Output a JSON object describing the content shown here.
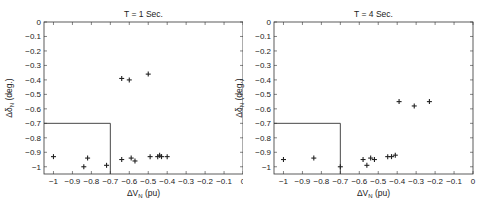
{
  "chart_data": [
    {
      "type": "scatter",
      "title": "T = 1 Sec.",
      "xlabel": "ΔV_N (pu)",
      "ylabel": "Δδ_N (deg.)",
      "xlim": [
        -1.05,
        0
      ],
      "ylim": [
        -1.05,
        0
      ],
      "xticks": [
        -1,
        -0.9,
        -0.8,
        -0.7,
        -0.6,
        -0.5,
        -0.4,
        -0.3,
        -0.2,
        -0.1,
        0
      ],
      "xtick_labels": [
        "-1",
        "-0.9",
        "-0.8",
        "-0.7",
        "-0.6",
        "-0.5",
        "-0.4",
        "-0.3",
        "-0.2",
        "-0.1",
        "0"
      ],
      "yticks": [
        0,
        -0.1,
        -0.2,
        -0.3,
        -0.4,
        -0.5,
        -0.6,
        -0.7,
        -0.8,
        -0.9,
        -1
      ],
      "ytick_labels": [
        "0",
        "-0.1",
        "-0.2",
        "-0.3",
        "-0.4",
        "-0.5",
        "-0.6",
        "-0.7",
        "-0.8",
        "-0.9",
        "-1"
      ],
      "grid": false,
      "marker": "+",
      "region_box": {
        "x": [
          -1.05,
          -0.7
        ],
        "y": [
          -1.05,
          -0.7
        ]
      },
      "points": [
        {
          "x": -1.0,
          "y": -0.93
        },
        {
          "x": -0.84,
          "y": -1.0
        },
        {
          "x": -0.82,
          "y": -0.94
        },
        {
          "x": -0.72,
          "y": -0.99
        },
        {
          "x": -0.64,
          "y": -0.95
        },
        {
          "x": -0.59,
          "y": -0.94
        },
        {
          "x": -0.57,
          "y": -0.96
        },
        {
          "x": -0.49,
          "y": -0.93
        },
        {
          "x": -0.45,
          "y": -0.93
        },
        {
          "x": -0.44,
          "y": -0.92
        },
        {
          "x": -0.43,
          "y": -0.93
        },
        {
          "x": -0.4,
          "y": -0.93
        },
        {
          "x": -0.64,
          "y": -0.39
        },
        {
          "x": -0.6,
          "y": -0.4
        },
        {
          "x": -0.5,
          "y": -0.36
        }
      ]
    },
    {
      "type": "scatter",
      "title": "T = 4 Sec.",
      "xlabel": "ΔV_N (pu)",
      "ylabel": "Δδ_N (deg.)",
      "xlim": [
        -1.05,
        0
      ],
      "ylim": [
        -1.05,
        0
      ],
      "xticks": [
        -1,
        -0.9,
        -0.8,
        -0.7,
        -0.6,
        -0.5,
        -0.4,
        -0.3,
        -0.2,
        -0.1,
        0
      ],
      "xtick_labels": [
        "-1",
        "-0.9",
        "-0.8",
        "-0.7",
        "-0.6",
        "-0.5",
        "-0.4",
        "-0.3",
        "-0.2",
        "-0.1",
        "0"
      ],
      "yticks": [
        0,
        -0.1,
        -0.2,
        -0.3,
        -0.4,
        -0.5,
        -0.6,
        -0.7,
        -0.8,
        -0.9,
        -1
      ],
      "ytick_labels": [
        "0",
        "-0.1",
        "-0.2",
        "-0.3",
        "-0.4",
        "-0.5",
        "-0.6",
        "-0.7",
        "-0.8",
        "-0.9",
        "-1"
      ],
      "grid": false,
      "marker": "+",
      "region_box": {
        "x": [
          -1.05,
          -0.7
        ],
        "y": [
          -1.05,
          -0.7
        ]
      },
      "points": [
        {
          "x": -1.0,
          "y": -0.95
        },
        {
          "x": -0.84,
          "y": -0.94
        },
        {
          "x": -0.7,
          "y": -1.0
        },
        {
          "x": -0.58,
          "y": -0.95
        },
        {
          "x": -0.56,
          "y": -0.99
        },
        {
          "x": -0.54,
          "y": -0.94
        },
        {
          "x": -0.52,
          "y": -0.95
        },
        {
          "x": -0.45,
          "y": -0.93
        },
        {
          "x": -0.43,
          "y": -0.93
        },
        {
          "x": -0.41,
          "y": -0.92
        },
        {
          "x": -0.39,
          "y": -0.55
        },
        {
          "x": -0.31,
          "y": -0.58
        },
        {
          "x": -0.23,
          "y": -0.55
        }
      ]
    }
  ],
  "colors": {
    "axis": "#333333",
    "marker": "#222222",
    "background": "#ffffff"
  }
}
